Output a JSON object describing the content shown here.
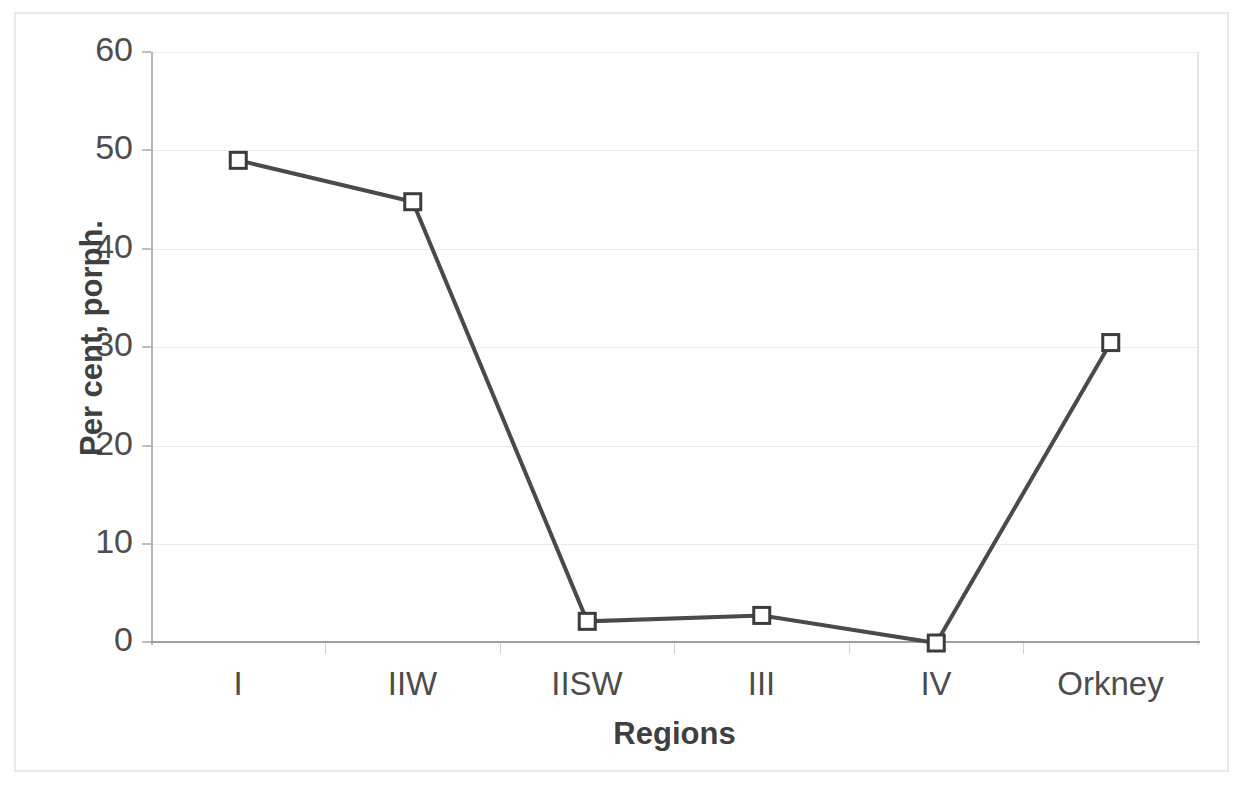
{
  "chart_data": {
    "type": "line",
    "title": "",
    "subtitle": "",
    "xlabel": "Regions",
    "ylabel": "Per cent, porph.",
    "categories": [
      "I",
      "IIW",
      "IISW",
      "III",
      "IV",
      "Orkney"
    ],
    "values": [
      49.0,
      44.8,
      2.2,
      2.8,
      0.0,
      30.5
    ],
    "series": [
      {
        "name": "Per cent, porph.",
        "values": [
          49.0,
          44.8,
          2.2,
          2.8,
          0.0,
          30.5
        ]
      }
    ],
    "ylim": [
      0,
      60
    ],
    "ytick_labels": [
      "60",
      "50",
      "40",
      "30",
      "20",
      "10",
      "0"
    ],
    "ytick_values": [
      60,
      50,
      40,
      30,
      20,
      10,
      0
    ],
    "ytick_step": 10,
    "grid": "horizontal",
    "legend": "none",
    "marker": "open-square",
    "line_color": "#4a4a4a",
    "marker_fill_color": "#ffffff",
    "marker_edge_color": "#3c3c3c",
    "grid_color": "#ebebeb",
    "axis_color": "#a8a8a8",
    "text_color": "#4d4d4d",
    "label_color": "#3f3f3f",
    "background_color": "#ffffff"
  }
}
